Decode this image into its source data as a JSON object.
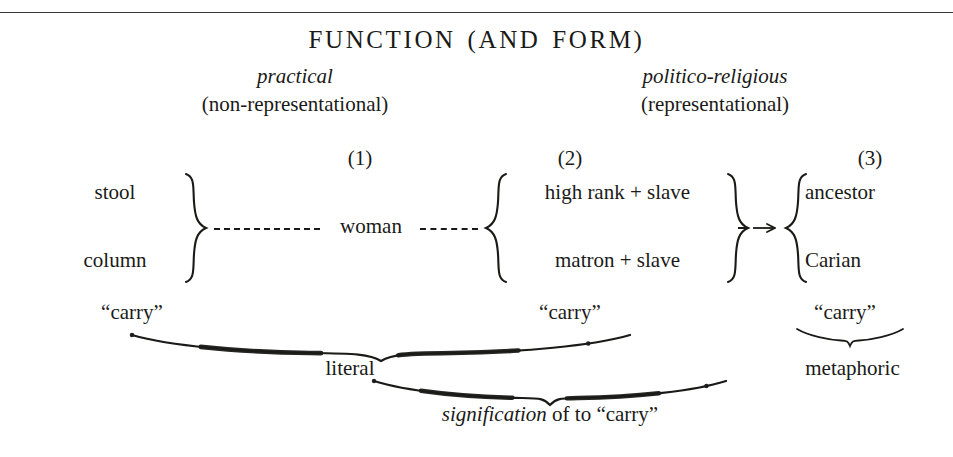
{
  "diagram": {
    "title": "FUNCTION (AND FORM)",
    "columns": {
      "left": {
        "emphasis": "practical",
        "qualifier": "(non-representational)",
        "marker": "(1)"
      },
      "right": {
        "emphasis": "politico-religious",
        "qualifier": "(representational)",
        "marker": "(2)"
      },
      "far_right": {
        "marker": "(3)"
      }
    },
    "groups": {
      "group1": {
        "items": [
          "stool",
          "column"
        ]
      },
      "group2": {
        "items": [
          "high rank  +  slave",
          "matron  +  slave"
        ]
      },
      "group3": {
        "items": [
          "ancestor",
          "Carian"
        ]
      }
    },
    "connector_label": "woman",
    "carry_labels": {
      "first": "“carry”",
      "second": "“carry”",
      "third": "“carry”"
    },
    "brace_labels": {
      "literal": "literal",
      "metaphoric": "metaphoric",
      "signification_italic": "signification",
      "signification_rest": " of to “carry”"
    },
    "colors": {
      "ink": "#1a1a18",
      "rule": "#3b3b38",
      "background": "#ffffff"
    }
  }
}
